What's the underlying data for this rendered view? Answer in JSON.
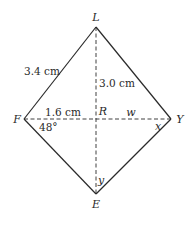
{
  "diagram": {
    "type": "kite",
    "vertices": {
      "L": {
        "label": "L",
        "x": 96,
        "y": 27
      },
      "F": {
        "label": "F",
        "x": 24,
        "y": 119
      },
      "Y": {
        "label": "Y",
        "x": 171,
        "y": 119
      },
      "E": {
        "label": "E",
        "x": 96,
        "y": 194
      },
      "R": {
        "label": "R",
        "x": 96,
        "y": 119
      }
    },
    "measurements": {
      "side_FL": "3.4 cm",
      "segment_LR": "3.0 cm",
      "segment_FR": "1.6 cm",
      "angle_F": "48°"
    },
    "unknowns": {
      "segment_RY": "w",
      "angle_Y": "x",
      "angle_E": "y"
    },
    "colors": {
      "line": "#2a2a2a",
      "background": "#ffffff"
    }
  }
}
